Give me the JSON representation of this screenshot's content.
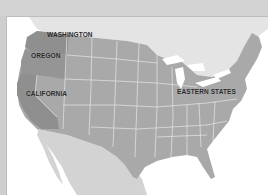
{
  "map": {
    "title": "",
    "colors": {
      "water": "#ffffff",
      "canada": "#e4e4e4",
      "mexico": "#d3d3d3",
      "us_states": "#a9a9a9",
      "highlighted_west": "#8f8f8f",
      "state_borders": "#e6e6e6",
      "frame": "#d2d2d2"
    },
    "labels": {
      "washington": "WASHINGTON",
      "oregon": "OREGON",
      "california": "CALIFORNIA",
      "eastern_states": "EASTERN STATES"
    },
    "highlighted_regions": [
      "Washington",
      "Oregon",
      "California"
    ]
  }
}
